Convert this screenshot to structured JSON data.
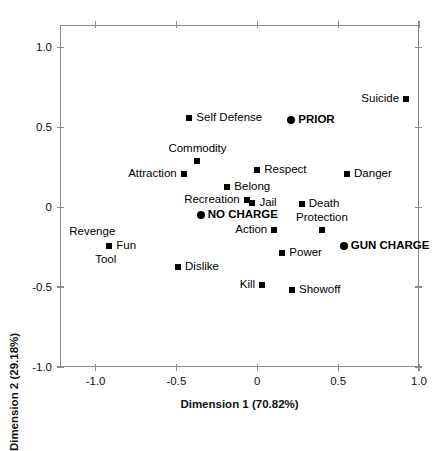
{
  "chart_data": {
    "type": "scatter",
    "title": "",
    "xlabel": "Dimension 1 (70.82%)",
    "ylabel": "Dimension 2 (29.18%)",
    "xlim": [
      -1.22,
      1.0
    ],
    "ylim": [
      -1.0,
      1.14
    ],
    "xticks": [
      "-1.0",
      "-0.5",
      "0",
      "0.5",
      "1.0"
    ],
    "xtick_values": [
      -1.0,
      -0.5,
      0,
      0.5,
      1.0
    ],
    "yticks": [
      "1.0",
      "0.5",
      "0",
      "-0.5",
      "-1.0"
    ],
    "ytick_values": [
      1.0,
      0.5,
      0,
      -0.5,
      -1.0
    ],
    "grid": false,
    "legend": "none",
    "marker_types": {
      "square": "attribute point",
      "circle": "charge-category point"
    },
    "points": [
      {
        "label": "Suicide",
        "x": 0.92,
        "y": 0.68,
        "marker": "square",
        "bold": false,
        "label_pos": "left"
      },
      {
        "label": "Self Defense",
        "x": -0.42,
        "y": 0.56,
        "marker": "square",
        "bold": false,
        "label_pos": "right"
      },
      {
        "label": "PRIOR",
        "x": 0.21,
        "y": 0.545,
        "marker": "circle",
        "bold": true,
        "label_pos": "right"
      },
      {
        "label": "Commodity",
        "x": -0.37,
        "y": 0.29,
        "marker": "square",
        "bold": false,
        "label_pos": "above"
      },
      {
        "label": "Respect",
        "x": 0.0,
        "y": 0.235,
        "marker": "square",
        "bold": false,
        "label_pos": "right"
      },
      {
        "label": "Danger",
        "x": 0.555,
        "y": 0.205,
        "marker": "square",
        "bold": false,
        "label_pos": "right"
      },
      {
        "label": "Attraction",
        "x": -0.455,
        "y": 0.21,
        "marker": "square",
        "bold": false,
        "label_pos": "left"
      },
      {
        "label": "Belong",
        "x": -0.185,
        "y": 0.125,
        "marker": "square",
        "bold": false,
        "label_pos": "right"
      },
      {
        "label": "Recreation",
        "x": -0.065,
        "y": 0.045,
        "marker": "square",
        "bold": false,
        "label_pos": "left"
      },
      {
        "label": "Jail",
        "x": -0.03,
        "y": 0.025,
        "marker": "square",
        "bold": false,
        "label_pos": "right"
      },
      {
        "label": "Death",
        "x": 0.275,
        "y": 0.02,
        "marker": "square",
        "bold": false,
        "label_pos": "right"
      },
      {
        "label": "NO CHARGE",
        "x": -0.35,
        "y": -0.05,
        "marker": "circle",
        "bold": true,
        "label_pos": "right"
      },
      {
        "label": "Protection",
        "x": 0.4,
        "y": -0.145,
        "marker": "square",
        "bold": false,
        "label_pos": "above"
      },
      {
        "label": "Action",
        "x": 0.105,
        "y": -0.145,
        "marker": "square",
        "bold": false,
        "label_pos": "left"
      },
      {
        "label": "GUN CHARGE",
        "x": 0.535,
        "y": -0.24,
        "marker": "circle",
        "bold": true,
        "label_pos": "right"
      },
      {
        "label": "Revenge",
        "x": -0.915,
        "y": -0.245,
        "marker": "square",
        "bold": false,
        "label_pos": "above-left"
      },
      {
        "label": "Fun",
        "x": -0.915,
        "y": -0.245,
        "marker": "square",
        "bold": false,
        "label_pos": "right"
      },
      {
        "label": "Tool",
        "x": -0.915,
        "y": -0.245,
        "marker": "square",
        "bold": false,
        "label_pos": "below-left"
      },
      {
        "label": "Power",
        "x": 0.155,
        "y": -0.285,
        "marker": "square",
        "bold": false,
        "label_pos": "right"
      },
      {
        "label": "Dislike",
        "x": -0.49,
        "y": -0.375,
        "marker": "square",
        "bold": false,
        "label_pos": "right"
      },
      {
        "label": "Kill",
        "x": 0.03,
        "y": -0.49,
        "marker": "square",
        "bold": false,
        "label_pos": "left"
      },
      {
        "label": "Showoff",
        "x": 0.215,
        "y": -0.52,
        "marker": "square",
        "bold": false,
        "label_pos": "right"
      }
    ]
  },
  "colors": {
    "marker": "#000000",
    "frame": "#8a8a8a",
    "text": "#111111",
    "background": "#ffffff"
  }
}
